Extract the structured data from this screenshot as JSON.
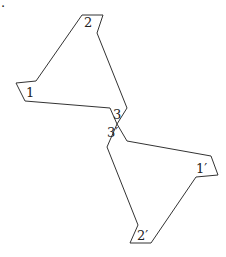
{
  "diagram": {
    "title": "",
    "stray_mark": ".",
    "shapes": [
      {
        "name": "upper-triangle",
        "labels": [
          {
            "text": "1",
            "x": 26,
            "y": 97
          },
          {
            "text": "2",
            "x": 84,
            "y": 27
          },
          {
            "text": "3",
            "x": 113,
            "y": 119
          }
        ]
      },
      {
        "name": "lower-triangle",
        "labels": [
          {
            "text": "3′",
            "x": 107,
            "y": 137
          },
          {
            "text": "1′",
            "x": 196,
            "y": 173
          },
          {
            "text": "2′",
            "x": 137,
            "y": 240
          }
        ]
      }
    ],
    "colors": {
      "stroke": "#333333",
      "text": "#222222",
      "background": "#ffffff"
    }
  }
}
